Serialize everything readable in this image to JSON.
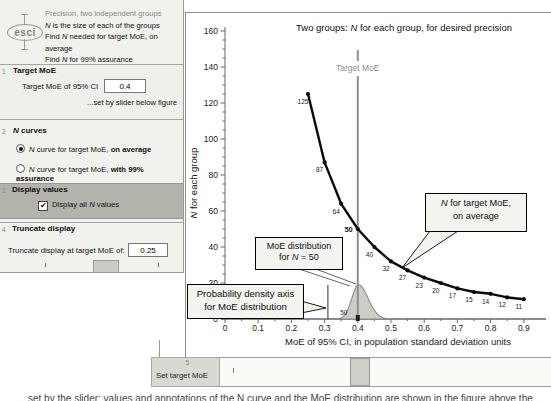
{
  "header": {
    "logo_text": "esci",
    "tagline": "Precision, two independent groups",
    "line1_n": "N",
    "line1_rest": " is the size of each of the groups",
    "line2_pre": "Find ",
    "line2_n": "N",
    "line2_rest": " needed for target MoE, on average",
    "line3_pre": "Find ",
    "line3_n": "N",
    "line3_rest": " for 99% assurance"
  },
  "sidebar": {
    "target_moe": {
      "num": "1",
      "title": "Target MoE",
      "field_label": "Target MoE of 95% CI",
      "value": "0.4",
      "hint": "...set by slider below figure"
    },
    "n_curves": {
      "num": "2",
      "title_n": "N",
      "title_rest": " curves",
      "radio1": {
        "n": "N",
        "text": " curve for target MoE, ",
        "bold": "on average",
        "selected": true
      },
      "radio2": {
        "n": "N",
        "text": " curve for target MoE, ",
        "bold": "with 99% assurance",
        "selected": false
      }
    },
    "display_values": {
      "num": "3",
      "title": "Display values",
      "check_glyph": "✔",
      "cb_pre": "Display all ",
      "cb_n": "N",
      "cb_post": " values",
      "checked": true
    },
    "truncate": {
      "num": "4",
      "title": "Truncate display",
      "field_label": "Truncate display at target MoE of:",
      "value": "0.25"
    }
  },
  "chart": {
    "title_pre": "Two groups: ",
    "title_n": "N",
    "title_post": " for each group, for desired precision",
    "ylabel_n": "N",
    "ylabel_rest": " for each group",
    "xlabel": "MoE of 95% CI, in population standard deviation units",
    "target_label": "Target MoE"
  },
  "chart_data": {
    "type": "line",
    "x": [
      0.25,
      0.3,
      0.35,
      0.4,
      0.45,
      0.5,
      0.55,
      0.6,
      0.65,
      0.7,
      0.75,
      0.8,
      0.85,
      0.9
    ],
    "values": [
      125,
      87,
      64,
      50,
      40,
      32,
      27,
      23,
      20,
      17,
      15,
      14,
      12,
      11
    ],
    "xlim": [
      0,
      0.95
    ],
    "ylim": [
      0,
      160
    ],
    "xtick_step": 0.1,
    "ytick_step": 20,
    "target_moe": 0.4,
    "highlight_n": 50,
    "density_axis_x": 0.31,
    "distribution": {
      "center": 0.402,
      "sigma_left": 0.02,
      "sigma_right": 0.029,
      "peak_n": 19,
      "label": "50"
    },
    "colors": {
      "curve": "#0a0a0a",
      "target_line": "#8f8f8f",
      "dist_fill": "#cdcdc7",
      "dist_stroke": "#8a8a8a",
      "axis": "#666666"
    }
  },
  "annotations": {
    "n_avg": {
      "line1_n": "N",
      "line1_rest": " for target MoE,",
      "line2": "on average"
    },
    "moe_dist": {
      "line1": "MoE distribution",
      "line2_pre": "for ",
      "line2_n": "N",
      "line2_post": " = 50"
    },
    "prob_axis": {
      "line1": "Probability density axis",
      "line2": "for MoE distribution"
    }
  },
  "bottom": {
    "num": "5",
    "label": "Set target MoE"
  },
  "caption_fragment": "set by the slider; values and annotations of the N curve and the MoE distribution are shown in the figure above the slider bar"
}
